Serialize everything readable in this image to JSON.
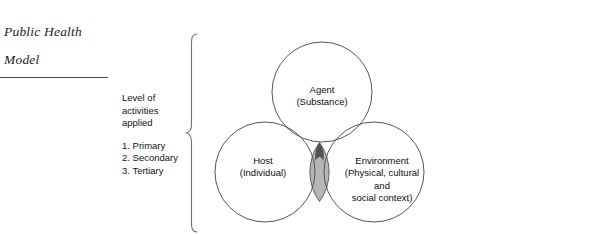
{
  "title": {
    "line1": "Public Health",
    "line2": "Model"
  },
  "legend": {
    "heading_line1": "Level of",
    "heading_line2": "activities",
    "heading_line3": "applied",
    "items": [
      "1. Primary",
      "2. Secondary",
      "3. Tertiary"
    ]
  },
  "diagram": {
    "type": "venn-three-circle",
    "circles": [
      {
        "id": "agent",
        "label_line1": "Agent",
        "label_line2": "(Substance)",
        "cx": 117,
        "cy": 58,
        "r": 50
      },
      {
        "id": "host",
        "label_line1": "Host",
        "label_line2": "(Individual)",
        "cx": 60,
        "cy": 138,
        "r": 50
      },
      {
        "id": "environment",
        "label_line1": "Environment",
        "label_line2": "(Physical, cultural",
        "label_line3": "and",
        "label_line4": "social context)",
        "cx": 169,
        "cy": 138,
        "r": 50
      }
    ],
    "intersection": {
      "id": "host-environment-overlap",
      "fill": "#b0b0b0",
      "tip_fill": "#565656"
    },
    "stroke": "#555555",
    "background": "#ffffff"
  }
}
